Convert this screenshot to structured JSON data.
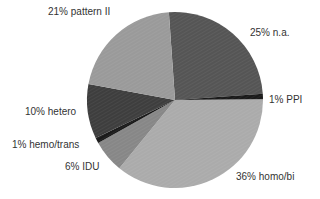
{
  "chart_data": {
    "type": "pie",
    "title": "",
    "start_angle_deg": -4,
    "direction": "clockwise",
    "slices": [
      {
        "label": "n.a.",
        "value": 25,
        "text": "25% n.a.",
        "color": "#555555"
      },
      {
        "label": "PPI",
        "value": 1,
        "text": "1% PPI",
        "color": "#1a1a1a"
      },
      {
        "label": "homo/bi",
        "value": 36,
        "text": "36% homo/bi",
        "color": "#ababab"
      },
      {
        "label": "IDU",
        "value": 6,
        "text": "6% IDU",
        "color": "#878787"
      },
      {
        "label": "hemo/trans",
        "value": 1,
        "text": "1% hemo/trans",
        "color": "#1a1a1a"
      },
      {
        "label": "hetero",
        "value": 10,
        "text": "10% hetero",
        "color": "#3e3e3e"
      },
      {
        "label": "pattern II",
        "value": 21,
        "text": "21% pattern II",
        "color": "#9a9a9a"
      }
    ],
    "legend": "none (direct labels)"
  },
  "labels": {
    "na": "25% n.a.",
    "ppi": "1% PPI",
    "homobi": "36% homo/bi",
    "idu": "6% IDU",
    "hemotrans": "1% hemo/trans",
    "hetero": "10% hetero",
    "pattern2": "21% pattern II"
  }
}
